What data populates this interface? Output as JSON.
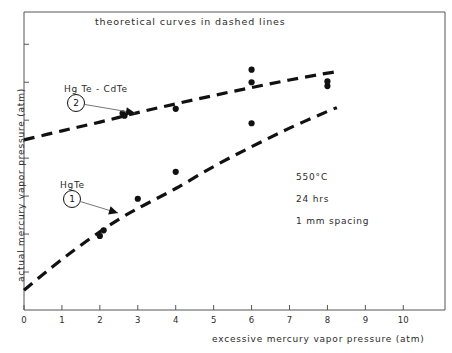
{
  "chart_data": {
    "type": "scatter",
    "title": "theoretical curves in dashed lines",
    "xlabel": "excessive mercury vapor pressure (atm)",
    "ylabel": "actual mercury vapor pressure (atm)",
    "xlim": [
      0,
      11.1
    ],
    "ylim": [
      0,
      7.85
    ],
    "grid": false,
    "legend_position": "inline-annotations",
    "xticks": [
      "0",
      "1",
      "2",
      "3",
      "4",
      "5",
      "6",
      "7",
      "8",
      "9",
      "10"
    ],
    "xtick_values": [
      0,
      1,
      2,
      3,
      4,
      5,
      6,
      7,
      8,
      9,
      10
    ],
    "yticks": [
      "",
      "",
      "",
      "",
      "",
      "",
      ""
    ],
    "ytick_values": [
      1,
      2,
      3,
      4,
      5,
      6,
      7
    ],
    "series": [
      {
        "name": "HgTe",
        "marker_label": "1",
        "linestyle": "dashed",
        "color": "#111111",
        "points_x": [
          2.0,
          2.1,
          3.0,
          4.0,
          6.0,
          8.0
        ],
        "points_y": [
          1.95,
          2.1,
          2.93,
          3.64,
          4.92,
          5.9
        ],
        "curve_x": [
          0.0,
          0.6,
          1.3,
          2.0,
          2.6,
          3.2,
          4.0,
          5.0,
          6.0,
          7.0,
          8.0,
          8.25
        ],
        "curve_y": [
          0.52,
          1.02,
          1.56,
          2.06,
          2.45,
          2.78,
          3.2,
          3.78,
          4.3,
          4.79,
          5.23,
          5.33
        ]
      },
      {
        "name": "Hg Te - CdTe",
        "marker_label": "2",
        "linestyle": "dashed",
        "color": "#111111",
        "points_x": [
          2.6,
          2.65,
          4.0,
          6.0,
          6.0,
          8.0
        ],
        "points_y": [
          5.18,
          5.12,
          5.3,
          6.33,
          6.0,
          6.02
        ],
        "curve_x": [
          0.0,
          1.0,
          2.0,
          3.0,
          4.0,
          5.0,
          6.0,
          7.0,
          8.0,
          8.25
        ],
        "curve_y": [
          4.48,
          4.72,
          4.95,
          5.2,
          5.43,
          5.65,
          5.86,
          6.06,
          6.24,
          6.28
        ]
      }
    ],
    "annotations": [
      {
        "name": "series-1-label",
        "text": "HgTe",
        "x_px": 60,
        "y_px": 180
      },
      {
        "name": "series-2-label",
        "text": "Hg Te - CdTe",
        "x_px": 64,
        "y_px": 84
      },
      {
        "name": "condition-temperature",
        "text": "550°C",
        "x_px": 296,
        "y_px": 172
      },
      {
        "name": "condition-duration",
        "text": "24 hrs",
        "x_px": 296,
        "y_px": 194
      },
      {
        "name": "condition-spacing",
        "text": "1 mm spacing",
        "x_px": 296,
        "y_px": 216
      }
    ]
  },
  "figure": {
    "background": "#ffffff",
    "axis_color": "#555555",
    "ink_color": "#111111"
  }
}
